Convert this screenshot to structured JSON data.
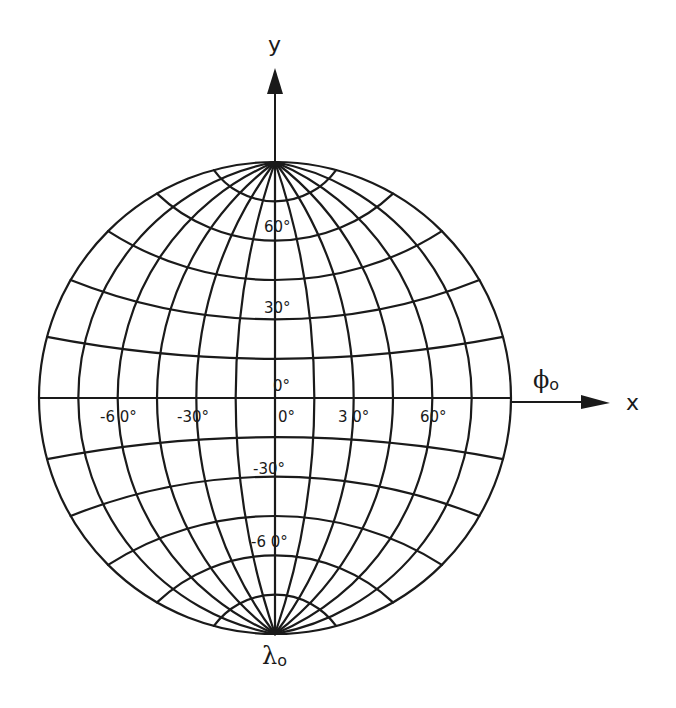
{
  "diagram": {
    "type": "globular map projection graticule",
    "center": [
      275,
      398
    ],
    "radius": 236,
    "graticule_step_deg": 15,
    "line_color": "#1a1a1a",
    "background": "#ffffff",
    "axes": {
      "x_label": "x",
      "y_label": "y",
      "phi_label": "ϕ",
      "phi_subscript": "o",
      "lambda_label": "λ",
      "lambda_subscript": "o"
    },
    "latitude_labels": [
      {
        "text": "60°",
        "lat": 60
      },
      {
        "text": "30°",
        "lat": 30
      },
      {
        "text": "0°",
        "lat": 0
      },
      {
        "text": "-30°",
        "lat": -30
      },
      {
        "text": "-6 0°",
        "lat": -60
      }
    ],
    "longitude_labels": [
      {
        "text": "-6 0°",
        "lon": -60
      },
      {
        "text": "-30°",
        "lon": -30
      },
      {
        "text": "0°",
        "lon": 0
      },
      {
        "text": "3 0°",
        "lon": 30
      },
      {
        "text": "60°",
        "lon": 60
      }
    ]
  }
}
